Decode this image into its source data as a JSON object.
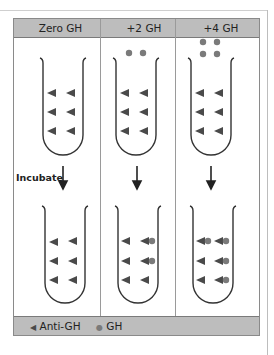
{
  "header": {
    "columns": [
      {
        "label": "Zero GH"
      },
      {
        "label": "+2 GH"
      },
      {
        "label": "+4 GH"
      }
    ]
  },
  "step_label": "Incubate",
  "legend": {
    "antibody_label": "Anti-GH",
    "antigen_label": "GH"
  },
  "colors": {
    "header_bg": "#bdbdbd",
    "triangle": "#4a4a4a",
    "dot": "#7a7a7a",
    "line": "#333333"
  },
  "tubes": {
    "before": [
      {
        "column": "Zero GH",
        "free_gh_dots": 0,
        "anti_gh": 6,
        "bound": 0
      },
      {
        "column": "+2 GH",
        "free_gh_dots": 2,
        "anti_gh": 6,
        "bound": 0
      },
      {
        "column": "+4 GH",
        "free_gh_dots": 4,
        "anti_gh": 6,
        "bound": 0
      }
    ],
    "after": [
      {
        "column": "Zero GH",
        "anti_gh": 6,
        "bound": 0
      },
      {
        "column": "+2 GH",
        "anti_gh": 6,
        "bound": 2
      },
      {
        "column": "+4 GH",
        "anti_gh": 6,
        "bound": 4
      }
    ]
  }
}
